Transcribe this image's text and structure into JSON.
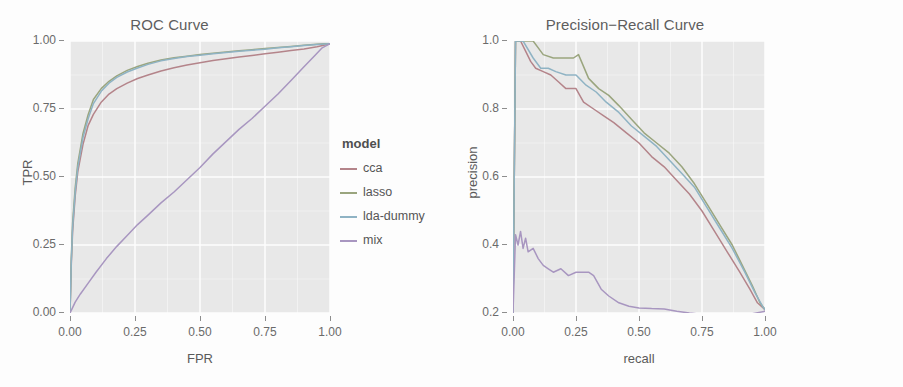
{
  "figure": {
    "background": "#fdfdfd",
    "panel_background": "#e8e8e8",
    "grid_color": "#ffffff"
  },
  "chart_data": [
    {
      "type": "line",
      "id": "roc",
      "title": "ROC Curve",
      "xlabel": "FPR",
      "ylabel": "TPR",
      "xlim": [
        0.0,
        1.0
      ],
      "ylim": [
        0.0,
        1.0
      ],
      "xticks": [
        "0.00",
        "0.25",
        "0.50",
        "0.75",
        "1.00"
      ],
      "xtick_values": [
        0.0,
        0.25,
        0.5,
        0.75,
        1.0
      ],
      "yticks": [
        "0.00",
        "0.25",
        "0.50",
        "0.75",
        "1.00"
      ],
      "ytick_values": [
        0.0,
        0.25,
        0.5,
        0.75,
        1.0
      ],
      "grid": true,
      "legend_title": "model",
      "legend_position": "right",
      "series": [
        {
          "name": "cca",
          "color": "#b4848a",
          "x": [
            0.0,
            0.005,
            0.01,
            0.02,
            0.03,
            0.05,
            0.07,
            0.09,
            0.12,
            0.15,
            0.18,
            0.22,
            0.26,
            0.3,
            0.35,
            0.4,
            0.45,
            0.5,
            0.55,
            0.6,
            0.65,
            0.7,
            0.75,
            0.8,
            0.85,
            0.9,
            0.95,
            0.98,
            1.0
          ],
          "y": [
            0.0,
            0.18,
            0.3,
            0.43,
            0.52,
            0.62,
            0.69,
            0.73,
            0.775,
            0.805,
            0.825,
            0.845,
            0.862,
            0.875,
            0.89,
            0.902,
            0.912,
            0.92,
            0.928,
            0.935,
            0.941,
            0.947,
            0.953,
            0.959,
            0.965,
            0.971,
            0.979,
            0.985,
            0.99
          ]
        },
        {
          "name": "lasso",
          "color": "#9aa57e",
          "x": [
            0.0,
            0.005,
            0.01,
            0.02,
            0.03,
            0.05,
            0.07,
            0.09,
            0.12,
            0.15,
            0.18,
            0.22,
            0.26,
            0.3,
            0.35,
            0.4,
            0.45,
            0.5,
            0.55,
            0.6,
            0.65,
            0.7,
            0.75,
            0.8,
            0.85,
            0.9,
            0.95,
            0.98,
            1.0
          ],
          "y": [
            0.0,
            0.2,
            0.33,
            0.46,
            0.55,
            0.66,
            0.73,
            0.785,
            0.825,
            0.852,
            0.872,
            0.892,
            0.906,
            0.918,
            0.93,
            0.938,
            0.944,
            0.95,
            0.955,
            0.96,
            0.964,
            0.968,
            0.972,
            0.976,
            0.98,
            0.984,
            0.988,
            0.99,
            0.99
          ]
        },
        {
          "name": "lda-dummy",
          "color": "#8fb3c4",
          "x": [
            0.0,
            0.005,
            0.01,
            0.02,
            0.03,
            0.05,
            0.07,
            0.09,
            0.12,
            0.15,
            0.18,
            0.22,
            0.26,
            0.3,
            0.35,
            0.4,
            0.45,
            0.5,
            0.55,
            0.6,
            0.65,
            0.7,
            0.75,
            0.8,
            0.85,
            0.9,
            0.95,
            0.98,
            1.0
          ],
          "y": [
            0.0,
            0.19,
            0.315,
            0.445,
            0.535,
            0.645,
            0.715,
            0.77,
            0.815,
            0.845,
            0.866,
            0.886,
            0.901,
            0.914,
            0.927,
            0.936,
            0.943,
            0.948,
            0.953,
            0.958,
            0.962,
            0.966,
            0.97,
            0.975,
            0.979,
            0.983,
            0.987,
            0.989,
            0.99
          ]
        },
        {
          "name": "mix",
          "color": "#a896c0",
          "x": [
            0.0,
            0.01,
            0.02,
            0.04,
            0.07,
            0.1,
            0.14,
            0.18,
            0.22,
            0.26,
            0.3,
            0.35,
            0.4,
            0.45,
            0.5,
            0.55,
            0.6,
            0.65,
            0.7,
            0.75,
            0.8,
            0.85,
            0.9,
            0.94,
            0.97,
            1.0
          ],
          "y": [
            0.0,
            0.02,
            0.04,
            0.07,
            0.11,
            0.15,
            0.2,
            0.245,
            0.285,
            0.325,
            0.36,
            0.405,
            0.445,
            0.49,
            0.535,
            0.585,
            0.63,
            0.675,
            0.715,
            0.76,
            0.805,
            0.855,
            0.905,
            0.945,
            0.975,
            0.99
          ]
        }
      ]
    },
    {
      "type": "line",
      "id": "pr",
      "title": "Precision−Recall Curve",
      "xlabel": "recall",
      "ylabel": "precision",
      "xlim": [
        0.0,
        1.0
      ],
      "ylim": [
        0.2,
        1.0
      ],
      "xticks": [
        "0.00",
        "0.25",
        "0.50",
        "0.75",
        "1.00"
      ],
      "xtick_values": [
        0.0,
        0.25,
        0.5,
        0.75,
        1.0
      ],
      "yticks": [
        "0.2",
        "0.4",
        "0.6",
        "0.8",
        "1.0"
      ],
      "ytick_values": [
        0.2,
        0.4,
        0.6,
        0.8,
        1.0
      ],
      "grid": true,
      "legend_title": "model",
      "legend_position": "right",
      "series": [
        {
          "name": "cca",
          "color": "#b4848a",
          "x": [
            0.0,
            0.01,
            0.03,
            0.05,
            0.07,
            0.09,
            0.12,
            0.15,
            0.18,
            0.21,
            0.25,
            0.28,
            0.32,
            0.36,
            0.4,
            0.45,
            0.5,
            0.55,
            0.6,
            0.65,
            0.7,
            0.75,
            0.8,
            0.85,
            0.9,
            0.94,
            0.97,
            1.0
          ],
          "y": [
            0.2,
            1.0,
            1.0,
            0.97,
            0.94,
            0.92,
            0.91,
            0.9,
            0.88,
            0.86,
            0.86,
            0.82,
            0.8,
            0.78,
            0.76,
            0.73,
            0.7,
            0.66,
            0.63,
            0.59,
            0.55,
            0.5,
            0.44,
            0.38,
            0.32,
            0.27,
            0.23,
            0.21
          ]
        },
        {
          "name": "lasso",
          "color": "#9aa57e",
          "x": [
            0.0,
            0.01,
            0.04,
            0.08,
            0.12,
            0.16,
            0.2,
            0.24,
            0.26,
            0.3,
            0.34,
            0.38,
            0.42,
            0.47,
            0.52,
            0.57,
            0.62,
            0.67,
            0.72,
            0.77,
            0.82,
            0.87,
            0.91,
            0.95,
            0.98,
            1.0
          ],
          "y": [
            0.2,
            1.0,
            1.0,
            1.0,
            0.96,
            0.95,
            0.95,
            0.95,
            0.96,
            0.89,
            0.86,
            0.84,
            0.81,
            0.77,
            0.73,
            0.7,
            0.67,
            0.63,
            0.58,
            0.52,
            0.46,
            0.4,
            0.34,
            0.28,
            0.23,
            0.21
          ]
        },
        {
          "name": "lda-dummy",
          "color": "#8fb3c4",
          "x": [
            0.0,
            0.01,
            0.04,
            0.08,
            0.11,
            0.14,
            0.17,
            0.21,
            0.25,
            0.29,
            0.33,
            0.37,
            0.42,
            0.47,
            0.52,
            0.57,
            0.62,
            0.67,
            0.72,
            0.77,
            0.82,
            0.87,
            0.92,
            0.96,
            0.99,
            1.0
          ],
          "y": [
            0.2,
            1.0,
            1.0,
            0.95,
            0.92,
            0.92,
            0.91,
            0.9,
            0.9,
            0.87,
            0.85,
            0.82,
            0.79,
            0.75,
            0.72,
            0.69,
            0.65,
            0.61,
            0.57,
            0.51,
            0.45,
            0.39,
            0.32,
            0.26,
            0.22,
            0.21
          ]
        },
        {
          "name": "mix",
          "color": "#a896c0",
          "x": [
            0.0,
            0.01,
            0.02,
            0.03,
            0.04,
            0.05,
            0.06,
            0.08,
            0.1,
            0.12,
            0.14,
            0.16,
            0.19,
            0.22,
            0.25,
            0.28,
            0.3,
            0.32,
            0.35,
            0.38,
            0.42,
            0.46,
            0.5,
            0.55,
            0.6,
            0.65,
            0.7,
            0.75,
            0.8,
            0.85,
            0.9,
            0.95,
            1.0
          ],
          "y": [
            0.2,
            0.43,
            0.4,
            0.44,
            0.39,
            0.42,
            0.38,
            0.39,
            0.36,
            0.34,
            0.33,
            0.32,
            0.33,
            0.31,
            0.32,
            0.32,
            0.32,
            0.31,
            0.27,
            0.25,
            0.23,
            0.22,
            0.215,
            0.213,
            0.212,
            0.205,
            0.2,
            0.196,
            0.193,
            0.192,
            0.194,
            0.198,
            0.205
          ]
        }
      ]
    }
  ]
}
